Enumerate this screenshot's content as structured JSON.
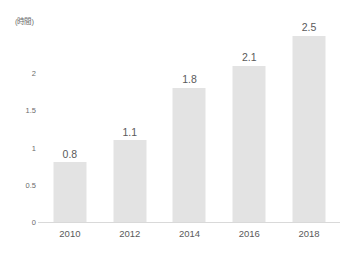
{
  "chart_data": {
    "type": "bar",
    "title": "",
    "subtitle": "",
    "unit_label": "(時間)",
    "xlabel": "",
    "ylabel": "",
    "categories": [
      "2010",
      "2012",
      "2014",
      "2016",
      "2018"
    ],
    "values": [
      0.8,
      1.1,
      1.8,
      2.1,
      2.5
    ],
    "data_labels": [
      "0.8",
      "1.1",
      "1.8",
      "2.1",
      "2.5"
    ],
    "series": [
      {
        "name": "",
        "values": [
          0.8,
          1.1,
          1.8,
          2.1,
          2.5
        ]
      }
    ],
    "yticks": [
      0,
      0.5,
      1,
      1.5,
      2
    ],
    "ytick_labels": [
      "0",
      "0.5",
      "1",
      "1.5",
      "2"
    ],
    "ylim": [
      0,
      2.8
    ],
    "grid": false,
    "legend": false,
    "legend_position": "none",
    "annotations": [],
    "colors": {
      "bar_fill": "#e3e3e3",
      "axis_line": "#d9d9d9",
      "tick_text": "#6b6b6b",
      "label_text": "#5a5a5a",
      "background": "#ffffff"
    }
  }
}
